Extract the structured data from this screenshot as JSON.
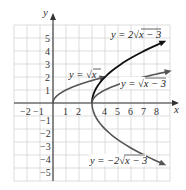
{
  "chart_data": {
    "type": "line",
    "title": "",
    "xlabel": "x",
    "ylabel": "y",
    "xlim": [
      -3,
      9
    ],
    "ylim": [
      -6,
      6
    ],
    "grid": true,
    "x_ticks": [
      -2,
      -1,
      1,
      2,
      4,
      5,
      6,
      7,
      8
    ],
    "x_tick_labels": [
      "−2",
      "−1",
      "1",
      "2",
      "4",
      "5",
      "6",
      "7",
      "8"
    ],
    "y_ticks": [
      5,
      4,
      3,
      2,
      1,
      -1,
      -2,
      -3,
      -4,
      -5
    ],
    "y_tick_labels": [
      "5",
      "4",
      "3",
      "2",
      "1",
      "−1",
      "−2",
      "−3",
      "−4",
      "−5"
    ],
    "series": [
      {
        "name": "y = √x",
        "label": "y = √x",
        "formula": "sqrt(x)",
        "x_start": 0,
        "x_end": 4,
        "color": "#555555",
        "points": [
          [
            0,
            0
          ],
          [
            1,
            1
          ],
          [
            2,
            1.41
          ],
          [
            3,
            1.73
          ],
          [
            4,
            2
          ]
        ]
      },
      {
        "name": "y = 2√(x − 3)",
        "label": "y = 2√x − 3",
        "formula": "2*sqrt(x-3)",
        "x_start": 3,
        "x_end": 9,
        "color": "#111111",
        "points": [
          [
            3,
            0
          ],
          [
            4,
            2
          ],
          [
            5,
            2.83
          ],
          [
            6,
            3.46
          ],
          [
            7,
            4
          ],
          [
            8,
            4.47
          ],
          [
            9,
            4.9
          ]
        ]
      },
      {
        "name": "y = √(x − 3)",
        "label": "y = √x − 3",
        "formula": "sqrt(x-3)",
        "x_start": 3,
        "x_end": 9,
        "color": "#555555",
        "points": [
          [
            3,
            0
          ],
          [
            4,
            1
          ],
          [
            5,
            1.41
          ],
          [
            6,
            1.73
          ],
          [
            7,
            2
          ],
          [
            8,
            2.24
          ],
          [
            9,
            2.45
          ]
        ]
      },
      {
        "name": "y = −2√(x − 3)",
        "label": "y = −2√x − 3",
        "formula": "-2*sqrt(x-3)",
        "x_start": 3,
        "x_end": 9,
        "color": "#555555",
        "points": [
          [
            3,
            0
          ],
          [
            4,
            -2
          ],
          [
            5,
            -2.83
          ],
          [
            6,
            -3.46
          ],
          [
            7,
            -4
          ],
          [
            8,
            -4.47
          ],
          [
            9,
            -4.9
          ]
        ]
      }
    ],
    "legend": "inline labels"
  },
  "labels": {
    "x_axis": "x",
    "y_axis": "y",
    "sqrt_x": {
      "prefix": "y = ",
      "radicand": "x"
    },
    "two_sqrt": {
      "prefix": "y = 2",
      "radicand": "x − 3"
    },
    "sqrt_shift": {
      "prefix": "y = ",
      "radicand": "x − 3"
    },
    "neg_two_sqrt": {
      "prefix": "y = −2",
      "radicand": "x − 3"
    }
  }
}
